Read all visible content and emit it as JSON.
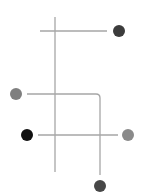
{
  "diagram": {
    "width": 144,
    "height": 195,
    "background": "#ffffff",
    "line_color": "#a6a6a6",
    "line_width": 1.3,
    "lines": [
      {
        "id": "vertical-a",
        "x1": 55,
        "y1": 17,
        "x2": 55,
        "y2": 172
      },
      {
        "id": "horizontal-top",
        "x1": 40,
        "y1": 31,
        "x2": 107,
        "y2": 31
      },
      {
        "id": "horizontal-mid",
        "x1": 27,
        "y1": 94,
        "x2": 96,
        "y2": 94
      },
      {
        "id": "vertical-b",
        "x1": 100,
        "y1": 98,
        "x2": 100,
        "y2": 175
      },
      {
        "id": "horizontal-low",
        "x1": 38,
        "y1": 135,
        "x2": 118,
        "y2": 135
      }
    ],
    "corner": {
      "id": "corner-mid",
      "path": "M96 94 Q100 94 100 98"
    },
    "nodes": [
      {
        "id": "node-top-right",
        "cx": 119,
        "cy": 31,
        "r": 6,
        "color": "#3c3c3c"
      },
      {
        "id": "node-mid-left",
        "cx": 16,
        "cy": 94,
        "r": 6,
        "color": "#7f7f7f"
      },
      {
        "id": "node-low-left",
        "cx": 27,
        "cy": 135,
        "r": 6,
        "color": "#111111"
      },
      {
        "id": "node-low-right",
        "cx": 128,
        "cy": 135,
        "r": 6,
        "color": "#8a8a8a"
      },
      {
        "id": "node-bottom",
        "cx": 100,
        "cy": 186,
        "r": 6,
        "color": "#474747"
      }
    ]
  }
}
